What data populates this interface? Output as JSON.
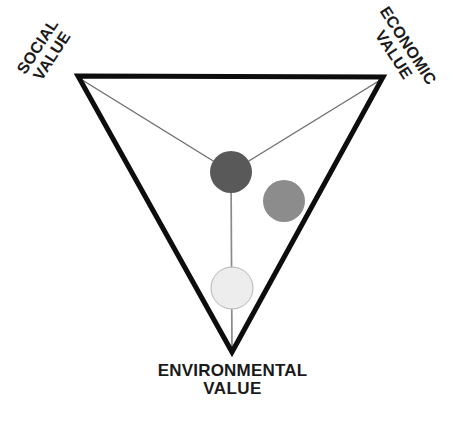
{
  "diagram": {
    "type": "inverted-triangle-framework",
    "background_color": "#ffffff",
    "outline_color": "#0d0d0d",
    "spoke_color": "#6e6e6e",
    "labels": {
      "social": {
        "line1": "SOCIAL",
        "line2": "VALUE",
        "rotation_deg": -57
      },
      "economic": {
        "line1": "ECONOMIC",
        "line2": "VALUE",
        "rotation_deg": 57
      },
      "environmental": {
        "line1": "ENVIRONMENTAL",
        "line2": "VALUE",
        "rotation_deg": 0
      }
    },
    "vertices": {
      "social": {
        "x": 78,
        "y": 76
      },
      "economic": {
        "x": 383,
        "y": 77
      },
      "environmental": {
        "x": 232,
        "y": 352
      }
    },
    "nodes": [
      {
        "name": "center-node",
        "fill": "#595959",
        "stroke": "none",
        "cx": 231,
        "cy": 172,
        "r": 21
      },
      {
        "name": "mid-gray-node",
        "fill": "#8c8c8c",
        "stroke": "none",
        "cx": 284,
        "cy": 201,
        "r": 21
      },
      {
        "name": "light-node",
        "fill": "#ededed",
        "stroke": "#b5b5b5",
        "cx": 232,
        "cy": 288,
        "r": 21
      }
    ],
    "connectors": [
      {
        "name": "spoke-social",
        "from": "social-vertex",
        "to": "center-node"
      },
      {
        "name": "spoke-economic",
        "from": "economic-vertex",
        "to": "center-node"
      },
      {
        "name": "spoke-environmental",
        "from": "center-node",
        "to": "environmental-vertex"
      }
    ]
  }
}
